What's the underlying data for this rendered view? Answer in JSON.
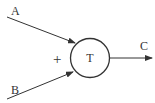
{
  "diagram": {
    "inputs": [
      {
        "label": "A"
      },
      {
        "label": "B"
      }
    ],
    "operator_sign": "+",
    "node": {
      "label": "T"
    },
    "output": {
      "label": "C"
    },
    "colors": {
      "stroke": "#333333",
      "background": "#ffffff"
    }
  }
}
